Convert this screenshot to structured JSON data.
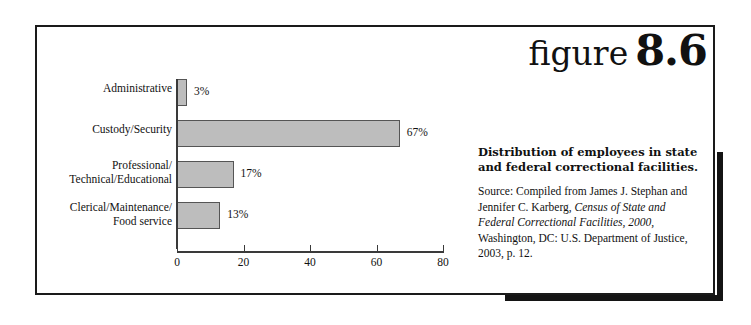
{
  "figure": {
    "word": "figure",
    "number": "8.6"
  },
  "caption": {
    "title": "Distribution of employees in state and federal correctional facilities.",
    "source_prefix": "Source: Compiled from James J. Stephan and Jennifer C. Karberg, ",
    "source_italic": "Census of State and Federal Correctional Facilities, 2000,",
    "source_suffix": " Washington, DC: U.S. Department of Justice, 2003, p. 12."
  },
  "chart_data": {
    "type": "bar",
    "orientation": "horizontal",
    "title": "Distribution of employees in state and federal correctional facilities.",
    "xlabel": "",
    "ylabel": "",
    "xlim": [
      0,
      80
    ],
    "xticks": [
      0,
      20,
      40,
      60,
      80
    ],
    "xtick_labels": [
      "0",
      "20",
      "40",
      "60",
      "80"
    ],
    "grid": false,
    "legend": false,
    "categories": [
      "Administrative",
      "Custody/Security",
      "Professional/\nTechnical/Educational",
      "Clerical/Maintenance/\nFood service"
    ],
    "category_lines": [
      [
        "Administrative"
      ],
      [
        "Custody/Security"
      ],
      [
        "Professional/",
        "Technical/Educational"
      ],
      [
        "Clerical/Maintenance/",
        "Food service"
      ]
    ],
    "values": [
      3,
      67,
      17,
      13
    ],
    "value_labels": [
      "3%",
      "67%",
      "17%",
      "13%"
    ],
    "bar_fill": "#bdbdbd",
    "bar_stroke": "#555555"
  }
}
